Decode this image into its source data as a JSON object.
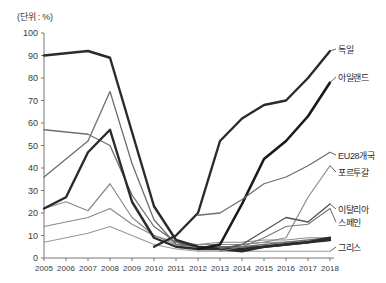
{
  "chart_data": {
    "type": "line",
    "title": "",
    "unit_note": "(단위 : %)",
    "xlabel": "",
    "ylabel": "",
    "grid": false,
    "legend_position": "right-inline",
    "xlim": [
      2005,
      2018
    ],
    "ylim": [
      0,
      100
    ],
    "ytick_step": 10,
    "categories": [
      2005,
      2006,
      2007,
      2008,
      2009,
      2010,
      2011,
      2012,
      2013,
      2014,
      2015,
      2016,
      2017,
      2018
    ],
    "xtick_labels": [
      "2005",
      "2006",
      "2007",
      "2008",
      "2009",
      "2010",
      "2011",
      "2012",
      "2013",
      "2014",
      "2015",
      "2016",
      "2017",
      "2018"
    ],
    "ytick_labels": [
      "0",
      "10",
      "20",
      "30",
      "40",
      "50",
      "60",
      "70",
      "80",
      "90",
      "100"
    ],
    "series": [
      {
        "name": "독일",
        "color": "#2b2b2b",
        "width": 2.4,
        "values": [
          90,
          91,
          92,
          89,
          56,
          23,
          8,
          5,
          4,
          4,
          5,
          6,
          7,
          8
        ]
      },
      {
        "name": "아일랜드",
        "color": "#2b2b2b",
        "width": 2.4,
        "values": [
          22,
          27,
          47,
          57,
          25,
          9,
          5,
          4,
          4,
          3,
          5,
          6,
          7,
          9
        ]
      },
      {
        "name": "EU28개국",
        "color": "#6e6e6e",
        "width": 1.3,
        "values": [
          57,
          56,
          55,
          50,
          28,
          14,
          7,
          5,
          5,
          5,
          6,
          7,
          8,
          9
        ]
      },
      {
        "name": "포르투갈",
        "color": "#6e6e6e",
        "width": 1.3,
        "values": [
          36,
          44,
          52,
          74,
          42,
          17,
          6,
          5,
          5,
          5,
          5,
          6,
          7,
          8
        ]
      },
      {
        "name": "이탈리아",
        "color": "#8a8a8a",
        "width": 1.2,
        "values": [
          22,
          25,
          21,
          33,
          18,
          10,
          6,
          6,
          6,
          6,
          7,
          7,
          7,
          8
        ]
      },
      {
        "name": "스페인",
        "color": "#8a8a8a",
        "width": 1.2,
        "values": [
          14,
          16,
          18,
          22,
          15,
          10,
          7,
          6,
          7,
          7,
          8,
          8,
          9,
          9
        ]
      },
      {
        "name": "그리스",
        "color": "#9a9a9a",
        "width": 1.2,
        "values": [
          7,
          9,
          11,
          14,
          10,
          6,
          4,
          3,
          3,
          3,
          3,
          3,
          3,
          3
        ]
      }
    ],
    "overlay_series": [
      {
        "name": "독일-상승",
        "color": "#2b2b2b",
        "width": 2.4,
        "x": [
          2010,
          2011,
          2012,
          2013,
          2014,
          2015,
          2016,
          2017,
          2018
        ],
        "y": [
          5,
          10,
          20,
          52,
          62,
          68,
          70,
          80,
          92
        ]
      },
      {
        "name": "아일랜드-상승",
        "color": "#1a1a1a",
        "width": 2.6,
        "x": [
          2012,
          2013,
          2014,
          2015,
          2016,
          2017,
          2018
        ],
        "y": [
          4,
          6,
          24,
          44,
          52,
          63,
          78
        ]
      },
      {
        "name": "EU28개국-상승",
        "color": "#6e6e6e",
        "width": 1.3,
        "x": [
          2012,
          2013,
          2014,
          2015,
          2016,
          2017,
          2018
        ],
        "y": [
          19,
          20,
          26,
          33,
          36,
          41,
          47
        ]
      },
      {
        "name": "포르투갈-상승",
        "color": "#8a8a8a",
        "width": 1.2,
        "x": [
          2014,
          2015,
          2016,
          2017,
          2018
        ],
        "y": [
          6,
          7,
          9,
          27,
          41
        ]
      },
      {
        "name": "이탈리아-상승",
        "color": "#555555",
        "width": 1.4,
        "x": [
          2013,
          2014,
          2015,
          2016,
          2017,
          2018
        ],
        "y": [
          4,
          6,
          12,
          18,
          16,
          24
        ]
      },
      {
        "name": "스페인-상승",
        "color": "#7a7a7a",
        "width": 1.2,
        "x": [
          2013,
          2014,
          2015,
          2016,
          2017,
          2018
        ],
        "y": [
          3,
          5,
          9,
          14,
          15,
          22
        ]
      }
    ],
    "annotations": []
  },
  "labels": {
    "germany": "독일",
    "ireland": "아일랜드",
    "eu28": "EU28개국",
    "portugal": "포르투갈",
    "italy": "이탈리아",
    "spain": "스페인",
    "greece": "그리스"
  }
}
